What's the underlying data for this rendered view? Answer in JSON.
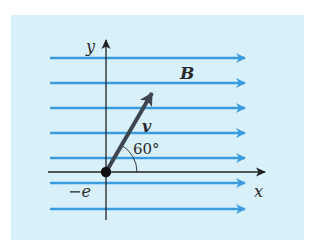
{
  "figure": {
    "background_color": "#ffffff",
    "panel_color": "#d8f0fa",
    "field_line_color": "#3a9be0",
    "axis_color": "#222222",
    "vector_color": "#3d4650"
  },
  "labels": {
    "y_axis": "y",
    "x_axis": "x",
    "field": "B",
    "velocity": "v",
    "angle": "60°",
    "charge": "−e"
  },
  "field_lines": {
    "count": 7,
    "direction": "+x"
  },
  "velocity": {
    "angle_deg": 60,
    "reference": "+x axis"
  }
}
